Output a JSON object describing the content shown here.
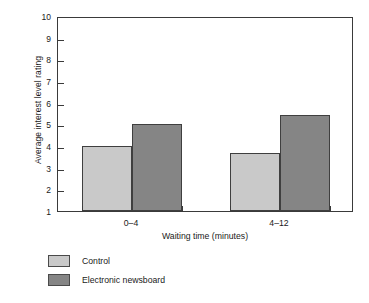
{
  "chart_data": {
    "type": "bar",
    "title": "",
    "subtitle": "",
    "xlabel": "Waiting time (minutes)",
    "ylabel": "Average interest level rating",
    "categories": [
      "0–4",
      "4–12"
    ],
    "series": [
      {
        "name": "Control",
        "values": [
          4.0,
          3.7
        ],
        "color": "#c9c9c9"
      },
      {
        "name": "Electronic newsboard",
        "values": [
          5.0,
          5.45
        ],
        "color": "#858585"
      }
    ],
    "ylim": [
      1,
      10
    ],
    "yticks": [
      1,
      2,
      3,
      4,
      5,
      6,
      7,
      8,
      9,
      10
    ],
    "ytick_labels": [
      "1",
      "2",
      "3",
      "4",
      "5",
      "6",
      "7",
      "8",
      "9",
      "10"
    ],
    "grid": false,
    "legend_position": "below-left",
    "frame": true,
    "bar_border_color": "#3f3f3f",
    "axis_color": "#3a3a3a",
    "background": "#ffffff"
  },
  "axes": {
    "y_title": "Average interest level rating",
    "x_title": "Waiting time (minutes)",
    "y_tick_labels": [
      "10",
      "9",
      "8",
      "7",
      "6",
      "5",
      "4",
      "3",
      "2",
      "1"
    ],
    "x_tick_labels": [
      "0–4",
      "4–12"
    ]
  },
  "legend": {
    "items": [
      {
        "label": "Control",
        "swatch": "control"
      },
      {
        "label": "Electronic newsboard",
        "swatch": "newsboard"
      }
    ]
  }
}
